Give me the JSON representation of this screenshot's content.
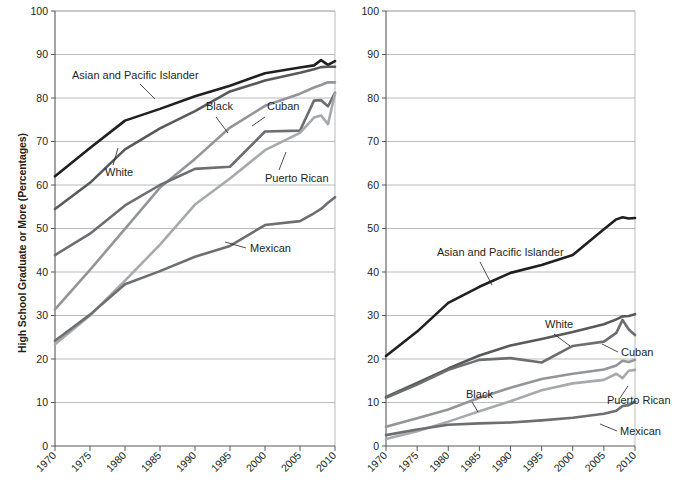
{
  "chart_data": [
    {
      "id": "high-school",
      "type": "line",
      "title": "",
      "xlabel": "",
      "ylabel": "High School Graduate or More (Percentages)",
      "xlim": [
        1970,
        2010
      ],
      "ylim": [
        0,
        100
      ],
      "xticks": [
        1970,
        1975,
        1980,
        1985,
        1990,
        1995,
        2000,
        2005,
        2010
      ],
      "yticks": [
        0,
        10,
        20,
        30,
        40,
        50,
        60,
        70,
        80,
        90,
        100
      ],
      "grid": true,
      "legend_position": "inline-annotations",
      "x": [
        1970,
        1975,
        1980,
        1985,
        1990,
        1995,
        2000,
        2005,
        2007,
        2008,
        2009,
        2010
      ],
      "series": [
        {
          "name": "Asian and Pacific Islander",
          "color": "#231f20",
          "width": 2.6,
          "values": [
            62.0,
            68.5,
            74.8,
            77.5,
            80.4,
            82.8,
            85.7,
            87.0,
            87.5,
            88.7,
            87.6,
            88.5
          ]
        },
        {
          "name": "White",
          "color": "#58595b",
          "width": 2.6,
          "values": [
            54.5,
            60.5,
            68.2,
            73.0,
            77.0,
            81.5,
            84.0,
            85.8,
            86.6,
            87.1,
            87.2,
            87.2
          ]
        },
        {
          "name": "Black",
          "color": "#939598",
          "width": 2.6,
          "values": [
            31.4,
            40.5,
            49.9,
            59.4,
            66.0,
            73.2,
            78.2,
            81.0,
            82.4,
            83.0,
            83.6,
            83.6
          ]
        },
        {
          "name": "Cuban",
          "color": "#6d6e71",
          "width": 2.6,
          "values": [
            43.9,
            48.8,
            55.3,
            60.0,
            63.7,
            64.2,
            72.3,
            72.5,
            79.4,
            79.5,
            78.1,
            81.2
          ]
        },
        {
          "name": "Puerto Rican",
          "color": "#a7a9ac",
          "width": 2.6,
          "values": [
            23.4,
            30.0,
            38.0,
            46.3,
            55.5,
            61.5,
            68.0,
            72.0,
            75.5,
            76.0,
            74.0,
            81.0
          ]
        },
        {
          "name": "Mexican",
          "color": "#6d6e71",
          "width": 2.6,
          "values": [
            24.2,
            30.2,
            37.2,
            40.2,
            43.5,
            46.0,
            50.8,
            51.7,
            53.5,
            54.5,
            55.9,
            57.2
          ]
        }
      ],
      "annotations": [
        {
          "label": "Asian and Pacific Islander",
          "x": 72,
          "y": 79,
          "lx1": 140,
          "ly1": 84,
          "lx2": 155,
          "ly2": 99
        },
        {
          "label": "White",
          "x": 105,
          "y": 176,
          "lx1": 113,
          "ly1": 165,
          "lx2": 118,
          "ly2": 148
        },
        {
          "label": "Black",
          "x": 206,
          "y": 110,
          "lx1": 216,
          "ly1": 117,
          "lx2": 228,
          "ly2": 133
        },
        {
          "label": "Cuban",
          "x": 267,
          "y": 110,
          "lx1": 265,
          "ly1": 117,
          "lx2": 252,
          "ly2": 126
        },
        {
          "label": "Puerto Rican",
          "x": 265,
          "y": 182,
          "lx1": 279,
          "ly1": 170,
          "lx2": 286,
          "ly2": 152
        },
        {
          "label": "Mexican",
          "x": 250,
          "y": 252,
          "lx1": 246,
          "ly1": 248,
          "lx2": 225,
          "ly2": 242
        }
      ]
    },
    {
      "id": "college",
      "type": "line",
      "title": "",
      "xlabel": "",
      "ylabel": "College Graduate or More (Percentages)",
      "xlim": [
        1970,
        2010
      ],
      "ylim": [
        0,
        100
      ],
      "xticks": [
        1970,
        1975,
        1980,
        1985,
        1990,
        1995,
        2000,
        2005,
        2010
      ],
      "yticks": [
        0,
        10,
        20,
        30,
        40,
        50,
        60,
        70,
        80,
        90,
        100
      ],
      "grid": true,
      "legend_position": "inline-annotations",
      "x": [
        1970,
        1975,
        1980,
        1985,
        1990,
        1995,
        2000,
        2005,
        2007,
        2008,
        2009,
        2010
      ],
      "series": [
        {
          "name": "Asian and Pacific Islander",
          "color": "#231f20",
          "width": 2.6,
          "values": [
            20.7,
            26.3,
            32.9,
            36.6,
            39.8,
            41.6,
            43.9,
            49.8,
            52.1,
            52.6,
            52.3,
            52.4
          ]
        },
        {
          "name": "White",
          "color": "#58595b",
          "width": 2.6,
          "values": [
            11.3,
            14.5,
            17.8,
            20.8,
            23.1,
            24.6,
            26.2,
            28.0,
            29.1,
            29.8,
            29.9,
            30.3
          ]
        },
        {
          "name": "Cuban",
          "color": "#6d6e71",
          "width": 2.6,
          "values": [
            11.1,
            14.1,
            17.5,
            19.8,
            20.2,
            19.2,
            23.0,
            24.0,
            26.0,
            29.0,
            26.8,
            25.5
          ]
        },
        {
          "name": "Black",
          "color": "#939598",
          "width": 2.6,
          "values": [
            4.4,
            6.4,
            8.4,
            11.1,
            13.4,
            15.4,
            16.6,
            17.6,
            18.5,
            19.6,
            19.3,
            19.8
          ]
        },
        {
          "name": "Puerto Rican",
          "color": "#a7a9ac",
          "width": 2.6,
          "values": [
            1.6,
            3.4,
            5.6,
            8.0,
            10.3,
            12.8,
            14.4,
            15.2,
            16.6,
            15.6,
            17.3,
            17.5
          ]
        },
        {
          "name": "Mexican",
          "color": "#6d6e71",
          "width": 2.6,
          "values": [
            2.5,
            3.8,
            4.9,
            5.2,
            5.4,
            5.9,
            6.5,
            7.4,
            8.1,
            9.2,
            9.4,
            10.2
          ]
        }
      ],
      "annotations": [
        {
          "label": "Asian and Pacific Islander",
          "x": 437,
          "y": 256,
          "lx1": 480,
          "ly1": 262,
          "lx2": 492,
          "ly2": 285
        },
        {
          "label": "White",
          "x": 545,
          "y": 328,
          "lx1": 554,
          "ly1": 334,
          "lx2": 570,
          "ly2": 346
        },
        {
          "label": "Cuban",
          "x": 621,
          "y": 356,
          "lx1": 618,
          "ly1": 352,
          "lx2": 602,
          "ly2": 344
        },
        {
          "label": "Black",
          "x": 466,
          "y": 398,
          "lx1": 472,
          "ly1": 402,
          "lx2": 478,
          "ly2": 412
        },
        {
          "label": "Puerto Rican",
          "x": 607,
          "y": 404,
          "lx1": 620,
          "ly1": 398,
          "lx2": 628,
          "ly2": 386
        },
        {
          "label": "Mexican",
          "x": 620,
          "y": 435,
          "lx1": 617,
          "ly1": 431,
          "lx2": 600,
          "ly2": 424
        }
      ]
    }
  ],
  "panels": {
    "left": {
      "ylabel": "High School Graduate or More (Percentages)",
      "ytick_labels": [
        "0",
        "10",
        "20",
        "30",
        "40",
        "50",
        "60",
        "70",
        "80",
        "90",
        "100"
      ],
      "xtick_labels": [
        "1970",
        "1975",
        "1980",
        "1985",
        "1990",
        "1995",
        "2000",
        "2005",
        "2010"
      ]
    },
    "right": {
      "ylabel": "College Graduate or More (Percentages)",
      "ytick_labels": [
        "0",
        "10",
        "20",
        "30",
        "40",
        "50",
        "60",
        "70",
        "80",
        "90",
        "100"
      ],
      "xtick_labels": [
        "1970",
        "1975",
        "1980",
        "1985",
        "1990",
        "1995",
        "2000",
        "2005",
        "2010"
      ]
    }
  }
}
